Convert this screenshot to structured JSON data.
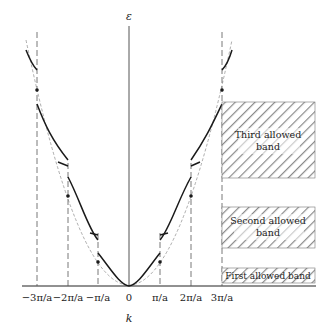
{
  "diagram": {
    "axis_labels": {
      "y": "ε",
      "x": "k"
    },
    "ticks": [
      "−3π/a",
      "−2π/a",
      "−π/a",
      "0",
      "π/a",
      "2π/a",
      "3π/a"
    ],
    "bands": [
      {
        "label_line1": "Third allowed",
        "label_line2": "band"
      },
      {
        "label_line1": "Second allowed",
        "label_line2": "band"
      },
      {
        "label_line1": "First allowed band",
        "label_line2": ""
      }
    ],
    "colors": {
      "line": "#1a1a1a",
      "hatch": "#8a8a8a",
      "dashed": "#555555"
    }
  }
}
